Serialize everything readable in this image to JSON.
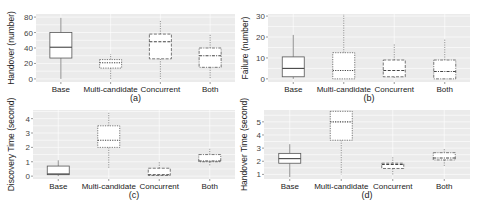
{
  "chart_data": [
    {
      "type": "box",
      "panel": "a",
      "caption": "(a)",
      "ylabel": "Handover (number)",
      "categories": [
        "Base",
        "Multi-candidate",
        "Concurrent",
        "Both"
      ],
      "yticks": [
        0,
        20,
        40,
        60,
        80
      ],
      "ylim": [
        -4,
        84
      ],
      "boxes": [
        {
          "name": "Base",
          "min": 0,
          "q1": 27,
          "median": 41,
          "q3": 60,
          "max": 79,
          "style": "solid"
        },
        {
          "name": "Multi-candidate",
          "min": 0,
          "q1": 14,
          "median": 21,
          "q3": 25,
          "max": 32,
          "style": "dotted"
        },
        {
          "name": "Concurrent",
          "min": 0,
          "q1": 26,
          "median": 48,
          "q3": 58,
          "max": 75,
          "style": "dashed"
        },
        {
          "name": "Both",
          "min": 0,
          "q1": 15,
          "median": 30,
          "q3": 40,
          "max": 58,
          "style": "dotdash"
        }
      ]
    },
    {
      "type": "box",
      "panel": "b",
      "caption": "(b)",
      "ylabel": "Failure (number)",
      "categories": [
        "Base",
        "Multi-candidate",
        "Concurrent",
        "Both"
      ],
      "yticks": [
        0,
        10,
        20,
        30
      ],
      "ylim": [
        -1.5,
        31
      ],
      "boxes": [
        {
          "name": "Base",
          "min": 0,
          "q1": 1,
          "median": 5,
          "q3": 10.5,
          "max": 21,
          "style": "solid"
        },
        {
          "name": "Multi-candidate",
          "min": 0,
          "q1": 0,
          "median": 4,
          "q3": 12.5,
          "max": 31,
          "style": "dotted"
        },
        {
          "name": "Concurrent",
          "min": 0,
          "q1": 1,
          "median": 4,
          "q3": 9,
          "max": 17,
          "style": "dashed"
        },
        {
          "name": "Both",
          "min": 0,
          "q1": 0,
          "median": 3.5,
          "q3": 9,
          "max": 19,
          "style": "dotdash"
        }
      ]
    },
    {
      "type": "box",
      "panel": "c",
      "caption": "(c)",
      "ylabel": "Discovery Time (second)",
      "categories": [
        "Base",
        "Multi-candidate",
        "Concurrent",
        "Both"
      ],
      "yticks": [
        0,
        1,
        2,
        3,
        4
      ],
      "ylim": [
        -0.2,
        4.6
      ],
      "boxes": [
        {
          "name": "Base",
          "min": 0,
          "q1": 0.1,
          "median": 0.15,
          "q3": 0.7,
          "max": 1.1,
          "style": "solid"
        },
        {
          "name": "Multi-candidate",
          "min": 0.5,
          "q1": 2.0,
          "median": 2.5,
          "q3": 3.5,
          "max": 4.4,
          "style": "dotted"
        },
        {
          "name": "Concurrent",
          "min": 0,
          "q1": 0.05,
          "median": 0.1,
          "q3": 0.55,
          "max": 1.0,
          "style": "dashed"
        },
        {
          "name": "Both",
          "min": 0.7,
          "q1": 1.0,
          "median": 1.05,
          "q3": 1.5,
          "max": 1.9,
          "style": "dotdash"
        }
      ]
    },
    {
      "type": "box",
      "panel": "d",
      "caption": "(d)",
      "ylabel": "Handover Time (second)",
      "categories": [
        "Base",
        "Multi-candidate",
        "Concurrent",
        "Both"
      ],
      "yticks": [
        1,
        2,
        3,
        4,
        5
      ],
      "ylim": [
        0.65,
        5.9
      ],
      "boxes": [
        {
          "name": "Base",
          "min": 0.8,
          "q1": 1.85,
          "median": 2.2,
          "q3": 2.6,
          "max": 3.3,
          "style": "solid"
        },
        {
          "name": "Multi-candidate",
          "min": 1.0,
          "q1": 3.6,
          "median": 5.0,
          "q3": 5.8,
          "max": 5.8,
          "style": "dotted"
        },
        {
          "name": "Concurrent",
          "min": 0.9,
          "q1": 1.45,
          "median": 1.75,
          "q3": 1.85,
          "max": 2.3,
          "style": "dashed"
        },
        {
          "name": "Both",
          "min": 1.6,
          "q1": 2.1,
          "median": 2.25,
          "q3": 2.65,
          "max": 3.0,
          "style": "dotdash"
        }
      ]
    }
  ],
  "layout": {
    "panels": [
      {
        "x0": 36,
        "x1": 235,
        "y0": 14,
        "y1": 82,
        "ylabel_x": 14,
        "caption_y": 101
      },
      {
        "x0": 268,
        "x1": 470,
        "y0": 14,
        "y1": 82,
        "ylabel_x": 248,
        "caption_y": 101
      },
      {
        "x0": 33,
        "x1": 235,
        "y0": 110,
        "y1": 179,
        "ylabel_x": 14,
        "caption_y": 198
      },
      {
        "x0": 264,
        "x1": 470,
        "y0": 110,
        "y1": 179,
        "ylabel_x": 247,
        "caption_y": 198
      }
    ]
  }
}
